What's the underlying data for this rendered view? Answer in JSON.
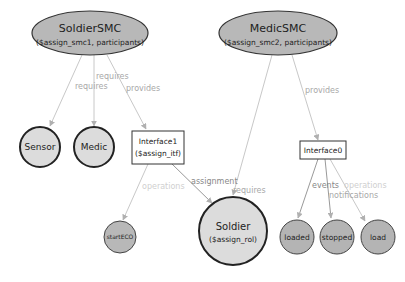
{
  "colors": {
    "ellipse_fill": "#b8b8b8",
    "circle_light_fill": "#dcdcdc",
    "circle_dark_fill": "#b4b4b4",
    "stroke": "#333333",
    "edge": "#c8c8c8",
    "edge_label": "#a8a8a8"
  },
  "nodes": {
    "soldier_smc": {
      "title": "SoldierSMC",
      "subtitle": "($assign_smc1, participants)"
    },
    "medic_smc": {
      "title": "MedicSMC",
      "subtitle": "($assign_smc2, participants)"
    },
    "sensor": {
      "label": "Sensor"
    },
    "medic": {
      "label": "Medic"
    },
    "interface1": {
      "title": "Interface1",
      "subtitle": "($assign_itf)"
    },
    "interface0": {
      "title": "Interface0"
    },
    "start_eco": {
      "label": "startECO"
    },
    "soldier": {
      "title": "Soldier",
      "subtitle": "($assign_rol)"
    },
    "loaded": {
      "label": "loaded"
    },
    "stopped": {
      "label": "stopped"
    },
    "load": {
      "label": "load"
    }
  },
  "edges": {
    "smc1_sensor": "requires",
    "smc1_medic": "requires",
    "smc1_interface1": "provides",
    "smc2_soldier": "requires",
    "smc2_interface0": "provides",
    "interface1_starteco": "operations",
    "interface1_soldier": "assignment",
    "interface0_loaded": "events",
    "interface0_stopped": "notifications",
    "interface0_load": "operations"
  }
}
